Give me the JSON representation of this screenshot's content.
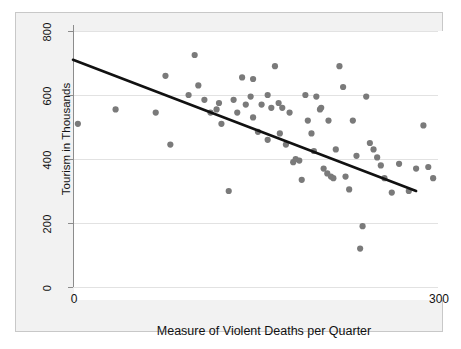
{
  "chart_data": {
    "type": "scatter",
    "title": "",
    "xlabel": "Measure of Violent Deaths per Quarter",
    "ylabel": "Tourism in Thousands",
    "xlim": [
      0,
      300
    ],
    "ylim": [
      0,
      840
    ],
    "xticks": [
      0,
      300
    ],
    "xtick_labels": [
      "0",
      "300"
    ],
    "yticks": [
      0,
      200,
      400,
      600,
      800
    ],
    "ytick_labels": [
      "0",
      "200",
      "400",
      "600",
      "800"
    ],
    "grid": true,
    "legend": "none",
    "point_color": "#7a7a7a",
    "line_color": "#111111",
    "grid_color": "#e2e2e2",
    "axis_color": "#8c8c8c",
    "panel_background": "#f2f2f2",
    "plot_background": "#ffffff",
    "series": [
      {
        "name": "Observations",
        "marker": "circle",
        "points": [
          [
            4,
            510
          ],
          [
            35,
            555
          ],
          [
            68,
            545
          ],
          [
            76,
            660
          ],
          [
            80,
            445
          ],
          [
            95,
            600
          ],
          [
            100,
            725
          ],
          [
            103,
            630
          ],
          [
            108,
            585
          ],
          [
            113,
            545
          ],
          [
            118,
            555
          ],
          [
            120,
            575
          ],
          [
            122,
            510
          ],
          [
            128,
            300
          ],
          [
            132,
            585
          ],
          [
            135,
            545
          ],
          [
            139,
            655
          ],
          [
            142,
            570
          ],
          [
            146,
            595
          ],
          [
            148,
            530
          ],
          [
            152,
            485
          ],
          [
            155,
            570
          ],
          [
            160,
            600
          ],
          [
            163,
            560
          ],
          [
            166,
            690
          ],
          [
            169,
            575
          ],
          [
            172,
            560
          ],
          [
            175,
            445
          ],
          [
            178,
            545
          ],
          [
            181,
            390
          ],
          [
            183,
            400
          ],
          [
            186,
            395
          ],
          [
            188,
            335
          ],
          [
            191,
            600
          ],
          [
            193,
            520
          ],
          [
            196,
            480
          ],
          [
            198,
            425
          ],
          [
            200,
            595
          ],
          [
            203,
            555
          ],
          [
            206,
            370
          ],
          [
            209,
            355
          ],
          [
            212,
            345
          ],
          [
            214,
            340
          ],
          [
            216,
            430
          ],
          [
            219,
            690
          ],
          [
            222,
            625
          ],
          [
            224,
            345
          ],
          [
            227,
            305
          ],
          [
            230,
            520
          ],
          [
            233,
            410
          ],
          [
            236,
            120
          ],
          [
            238,
            190
          ],
          [
            241,
            595
          ],
          [
            244,
            450
          ],
          [
            247,
            430
          ],
          [
            250,
            405
          ],
          [
            253,
            380
          ],
          [
            256,
            340
          ],
          [
            262,
            295
          ],
          [
            268,
            385
          ],
          [
            276,
            300
          ],
          [
            282,
            370
          ],
          [
            288,
            505
          ],
          [
            292,
            375
          ],
          [
            296,
            340
          ],
          [
            160,
            460
          ],
          [
            204,
            560
          ],
          [
            210,
            520
          ],
          [
            148,
            650
          ],
          [
            170,
            480
          ]
        ]
      }
    ],
    "trend_line": {
      "name": "Least squares fit",
      "x_start": 0,
      "y_start": 710,
      "x_end": 282,
      "y_end": 300
    }
  }
}
